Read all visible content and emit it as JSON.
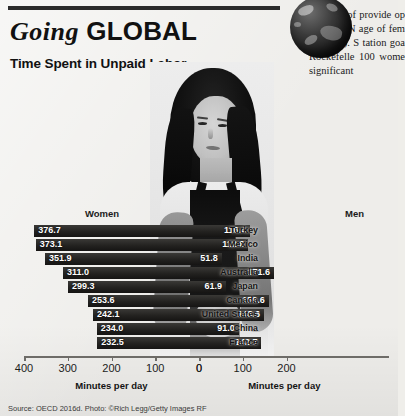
{
  "figure": {
    "headline_italic": "Going",
    "headline_bold": "GLOBAL",
    "subhead": "Time Spent in Unpaid Labor",
    "source": "Source: OECD 2016d. Photo: ©Rich Legg/Getty Images RF",
    "globe_alt": "globe-icon",
    "photo_alt": "woman-in-apron-photo"
  },
  "body_text": {
    "paragraph": "“Instead of provide op can do.” N age of fem al. 2016). S tation goa Rockefelle 100 wome significant"
  },
  "chart_data": {
    "type": "bar",
    "title": "Time Spent in Unpaid Labor",
    "subtype": "diverging-bidirectional-bar",
    "categories": [
      "Turkey",
      "Mexico",
      "India",
      "Australia",
      "Japan",
      "Canada",
      "United States",
      "China",
      "France"
    ],
    "series": [
      {
        "name": "Women",
        "values": [
          376.7,
          373.1,
          351.9,
          311.0,
          299.3,
          253.6,
          242.1,
          234.0,
          232.5
        ]
      },
      {
        "name": "Men",
        "values": [
          116.4,
          112.6,
          51.8,
          171.6,
          61.9,
          159.6,
          148.6,
          91.0,
          142.7
        ]
      }
    ],
    "left_axis": {
      "label": "Minutes per day",
      "ticks": [
        400,
        300,
        200,
        100,
        0
      ],
      "max": 400,
      "direction": "right-to-left"
    },
    "right_axis": {
      "label": "Minutes per day",
      "ticks": [
        0,
        100,
        200
      ],
      "max": 230,
      "direction": "left-to-right"
    },
    "grid": false,
    "legend_position": "above-columns",
    "bar_color": "#232220",
    "value_label_color": "#ffffff"
  }
}
